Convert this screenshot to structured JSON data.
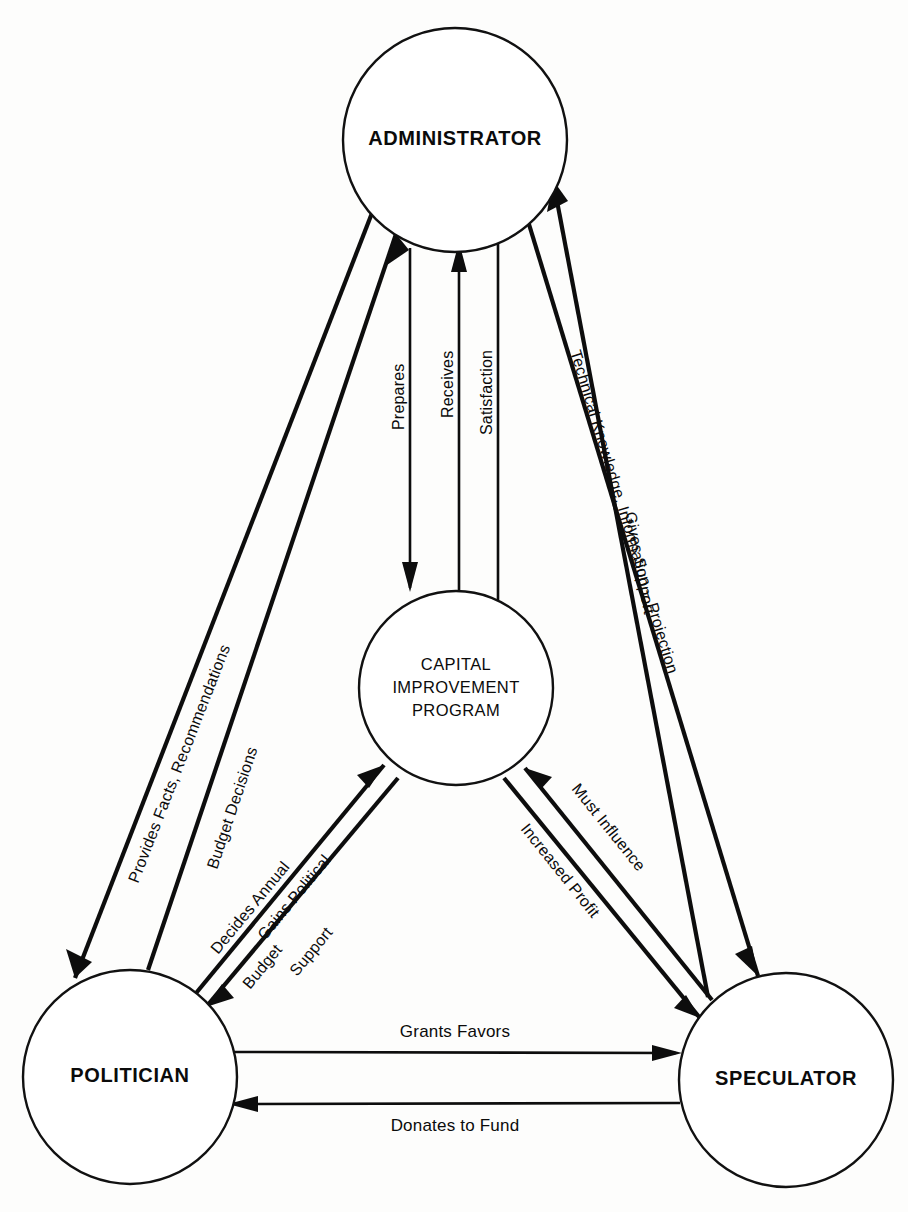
{
  "diagram": {
    "type": "relationship-diagram",
    "background_color": "#fdfdfc",
    "line_color": "#0d0d0d",
    "text_color": "#0b0b0b",
    "nodes": [
      {
        "id": "administrator",
        "label": "ADMINISTRATOR",
        "style": "bold",
        "shape": "circle",
        "center": [
          455,
          140
        ],
        "radius": 112
      },
      {
        "id": "capital-improvement-program",
        "label_lines": [
          "CAPITAL",
          "IMPROVEMENT",
          "PROGRAM"
        ],
        "line1": "CAPITAL",
        "line2": "IMPROVEMENT",
        "line3": "PROGRAM",
        "style": "regular",
        "shape": "circle",
        "center": [
          456,
          688
        ],
        "radius": 97
      },
      {
        "id": "politician",
        "label": "POLITICIAN",
        "style": "bold",
        "shape": "circle",
        "center": [
          130,
          1077
        ],
        "radius": 107
      },
      {
        "id": "speculator",
        "label": "SPECULATOR",
        "style": "bold",
        "shape": "circle",
        "center": [
          786,
          1080
        ],
        "radius": 107
      }
    ],
    "edges": [
      {
        "id": "provides-facts",
        "label": "Provides Facts, Recommendations",
        "from": "administrator",
        "to": "politician",
        "direction": "administrator-to-politician"
      },
      {
        "id": "budget-decisions",
        "label": "Budget Decisions",
        "from": "politician",
        "to": "administrator",
        "direction": "politician-to-administrator"
      },
      {
        "id": "prepares",
        "label": "Prepares",
        "from": "administrator",
        "to": "capital-improvement-program",
        "direction": "administrator-to-program"
      },
      {
        "id": "receives-satisfaction-a",
        "label": "Receives",
        "from": "capital-improvement-program",
        "to": "administrator",
        "direction": "program-to-administrator"
      },
      {
        "id": "receives-satisfaction-b",
        "label": "Satisfaction",
        "from": "capital-improvement-program",
        "to": "administrator",
        "direction": "program-to-administrator"
      },
      {
        "id": "technical-knowledge",
        "label": "Technical Knowledge, Information – Projection",
        "from": "administrator",
        "to": "speculator",
        "direction": "administrator-to-speculator"
      },
      {
        "id": "gives-support",
        "label": "Gives Support",
        "from": "speculator",
        "to": "administrator",
        "direction": "speculator-to-administrator"
      },
      {
        "id": "decides-annual-budget",
        "label_lines": [
          "Decides Annual",
          "Budget"
        ],
        "line1": "Decides Annual",
        "line2": "Budget",
        "from": "politician",
        "to": "capital-improvement-program",
        "direction": "politician-to-program"
      },
      {
        "id": "gains-political-support",
        "label_lines": [
          "Gains Political",
          "Support"
        ],
        "line1": "Gains Political",
        "line2": "Support",
        "from": "capital-improvement-program",
        "to": "politician",
        "direction": "program-to-politician"
      },
      {
        "id": "must-influence",
        "label": "Must Influence",
        "from": "speculator",
        "to": "capital-improvement-program",
        "direction": "speculator-to-program"
      },
      {
        "id": "increased-profit",
        "label": "Increased Profit",
        "from": "capital-improvement-program",
        "to": "speculator",
        "direction": "program-to-speculator"
      },
      {
        "id": "grants-favors",
        "label": "Grants Favors",
        "from": "politician",
        "to": "speculator",
        "direction": "politician-to-speculator"
      },
      {
        "id": "donates-to-fund",
        "label": "Donates to Fund",
        "from": "speculator",
        "to": "politician",
        "direction": "speculator-to-politician"
      }
    ]
  }
}
